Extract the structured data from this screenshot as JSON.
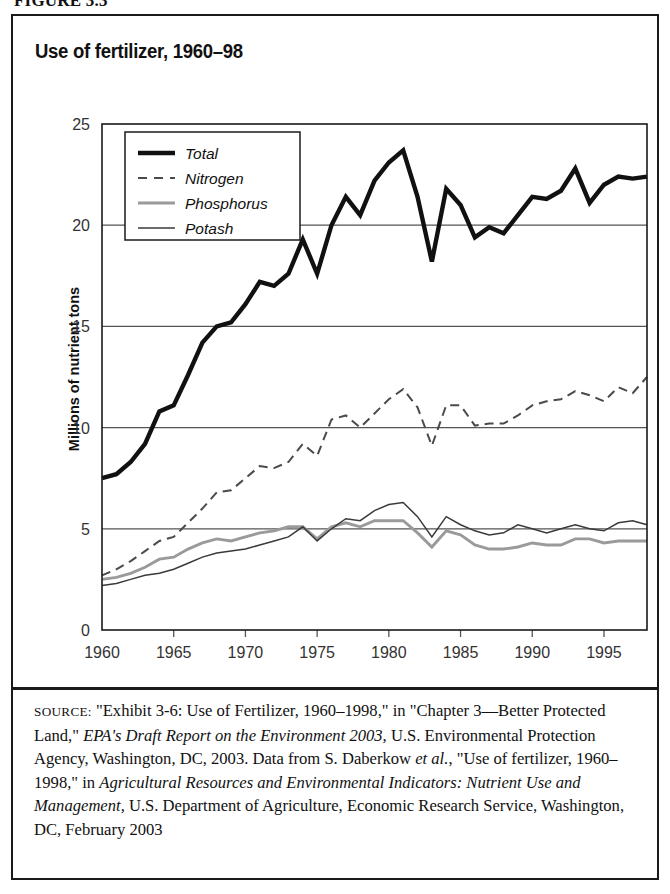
{
  "figure_label": "FIGURE 3.3",
  "chart_title": "Use of fertilizer, 1960–98",
  "y_axis_title": "Millions of nutrient tons",
  "source_note": {
    "label": "SOURCE:",
    "text": " \"Exhibit 3-6: Use of Fertilizer, 1960–1998,\" in \"Chapter 3—Better Protected Land,\" ",
    "italic1": "EPA's Draft Report on the Environment 2003,",
    "text2": " U.S. Environmental Protection Agency, Washington, DC, 2003. Data from S. Daberkow ",
    "italic2": "et al.",
    "text3": ", \"Use of fertilizer, 1960–1998,\" in ",
    "italic3": "Agricultural Resources and Environmental Indicators: Nutrient Use and Management,",
    "text4": " U.S. Department of Agriculture, Economic Research Service, Washington, DC, February 2003"
  },
  "colors": {
    "total": "#111111",
    "nitrogen": "#4a4a4a",
    "phosphorus": "#9a9a9a",
    "potash": "#3a3a3a",
    "grid": "#555555",
    "frame": "#1a1a1a",
    "background": "#ffffff"
  },
  "chart_data": {
    "type": "line",
    "title": "Use of fertilizer, 1960–98",
    "xlabel": "",
    "ylabel": "Millions of nutrient tons",
    "xlim": [
      1960,
      1998
    ],
    "ylim": [
      0,
      25
    ],
    "yticks": [
      0,
      5,
      10,
      15,
      20,
      25
    ],
    "xticks": [
      1960,
      1965,
      1970,
      1975,
      1980,
      1985,
      1990,
      1995
    ],
    "grid": "horizontal",
    "legend_position": "top-left",
    "x": [
      1960,
      1961,
      1962,
      1963,
      1964,
      1965,
      1966,
      1967,
      1968,
      1969,
      1970,
      1971,
      1972,
      1973,
      1974,
      1975,
      1976,
      1977,
      1978,
      1979,
      1980,
      1981,
      1982,
      1983,
      1984,
      1985,
      1986,
      1987,
      1988,
      1989,
      1990,
      1991,
      1992,
      1993,
      1994,
      1995,
      1996,
      1997,
      1998
    ],
    "series": [
      {
        "name": "Total",
        "style": "thick-solid",
        "color": "#111111",
        "values": [
          7.5,
          7.7,
          8.3,
          9.2,
          10.8,
          11.1,
          12.6,
          14.2,
          15.0,
          15.2,
          16.1,
          17.2,
          17.0,
          17.6,
          19.3,
          17.6,
          20.0,
          21.4,
          20.5,
          22.2,
          23.1,
          23.7,
          21.4,
          18.2,
          21.8,
          21.0,
          19.4,
          19.9,
          19.6,
          20.5,
          21.4,
          21.3,
          21.7,
          22.8,
          21.1,
          22.0,
          22.4,
          22.3,
          22.4
        ]
      },
      {
        "name": "Nitrogen",
        "style": "dashed",
        "color": "#4a4a4a",
        "values": [
          2.7,
          3.0,
          3.4,
          3.9,
          4.4,
          4.6,
          5.3,
          6.0,
          6.8,
          6.9,
          7.5,
          8.1,
          8.0,
          8.3,
          9.2,
          8.6,
          10.4,
          10.6,
          10.0,
          10.7,
          11.4,
          11.9,
          11.0,
          9.1,
          11.1,
          11.1,
          10.1,
          10.2,
          10.2,
          10.6,
          11.1,
          11.3,
          11.4,
          11.8,
          11.6,
          11.3,
          12.0,
          11.7,
          12.5
        ]
      },
      {
        "name": "Phosphorus",
        "style": "medium-gray",
        "color": "#9a9a9a",
        "values": [
          2.5,
          2.6,
          2.8,
          3.1,
          3.5,
          3.6,
          4.0,
          4.3,
          4.5,
          4.4,
          4.6,
          4.8,
          4.9,
          5.1,
          5.1,
          4.5,
          5.1,
          5.3,
          5.1,
          5.4,
          5.4,
          5.4,
          4.8,
          4.1,
          4.9,
          4.7,
          4.2,
          4.0,
          4.0,
          4.1,
          4.3,
          4.2,
          4.2,
          4.5,
          4.5,
          4.3,
          4.4,
          4.4,
          4.4
        ]
      },
      {
        "name": "Potash",
        "style": "thin-solid",
        "color": "#3a3a3a",
        "values": [
          2.2,
          2.3,
          2.5,
          2.7,
          2.8,
          3.0,
          3.3,
          3.6,
          3.8,
          3.9,
          4.0,
          4.2,
          4.4,
          4.6,
          5.1,
          4.4,
          5.0,
          5.5,
          5.4,
          5.9,
          6.2,
          6.3,
          5.6,
          4.6,
          5.6,
          5.2,
          4.9,
          4.7,
          4.8,
          5.2,
          5.0,
          4.8,
          5.0,
          5.2,
          5.0,
          4.9,
          5.3,
          5.4,
          5.2
        ]
      }
    ]
  },
  "legend": [
    {
      "label": "Total",
      "style": "thick-solid"
    },
    {
      "label": "Nitrogen",
      "style": "dashed"
    },
    {
      "label": "Phosphorus",
      "style": "medium-gray"
    },
    {
      "label": "Potash",
      "style": "thin-solid"
    }
  ]
}
